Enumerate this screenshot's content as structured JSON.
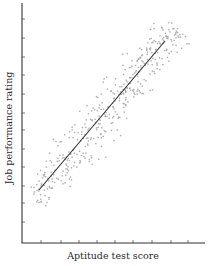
{
  "chart_data": {
    "type": "scatter",
    "title": "",
    "xlabel": "Aptitude test score",
    "ylabel": "Job performance rating",
    "grid": false,
    "legend": null,
    "x_ticks_count": 9,
    "y_ticks_count": 12,
    "tick_labels": false,
    "xlim": [
      0,
      10
    ],
    "ylim": [
      0,
      13
    ],
    "regression_line": {
      "x0": 1.0,
      "y0": 3.0,
      "x1": 7.9,
      "y1": 11.3
    },
    "correlation": "strong positive",
    "point_cloud": {
      "count": 420,
      "center": [
        4.6,
        7.0
      ],
      "spread_along_line": 4.6,
      "spread_across_line": 1.35,
      "marker": "small light-gray cross"
    },
    "annotations": []
  },
  "layout": {
    "plot": {
      "left": 22,
      "top": 3,
      "right": 205,
      "bottom": 243
    },
    "x_ticks_px": [
      41,
      61,
      79,
      97,
      115,
      133,
      152,
      171,
      188
    ],
    "y_ticks_px": [
      19,
      38,
      57,
      75,
      94,
      113,
      130,
      149,
      167,
      186,
      203,
      222
    ],
    "regression_px": {
      "x1": 39,
      "y1": 190,
      "x2": 165,
      "y2": 41
    }
  },
  "colors": {
    "axis": "#333333",
    "line": "#2e2e2e",
    "points": "#9a9a9a",
    "text": "#2a2a2a"
  }
}
